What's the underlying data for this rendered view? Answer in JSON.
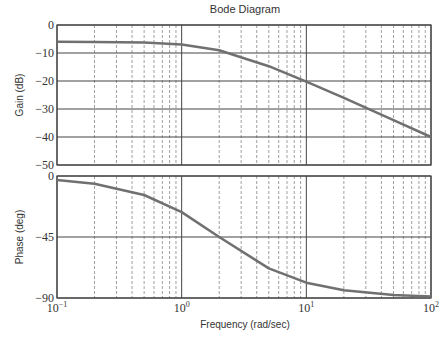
{
  "chart_data": [
    {
      "type": "line",
      "title": "Bode Diagram",
      "panel": "magnitude",
      "xlabel": "Frequency (rad/sec)",
      "ylabel": "Gain (dB)",
      "xscale": "log",
      "xlim": [
        0.1,
        100
      ],
      "ylim": [
        -50,
        0
      ],
      "yticks": [
        0,
        -10,
        -20,
        -30,
        -40,
        -50
      ],
      "grid": true,
      "series": [
        {
          "name": "Gain",
          "x": [
            0.1,
            0.2,
            0.5,
            1,
            2,
            5,
            10,
            20,
            50,
            100
          ],
          "values": [
            -6.0,
            -6.1,
            -6.3,
            -7.0,
            -9.0,
            -14.7,
            -20.2,
            -26.0,
            -34.0,
            -40.0
          ]
        }
      ]
    },
    {
      "type": "line",
      "panel": "phase",
      "xlabel": "Frequency (rad/sec)",
      "ylabel": "Phase (deg)",
      "xscale": "log",
      "xlim": [
        0.1,
        100
      ],
      "ylim": [
        -90,
        0
      ],
      "yticks": [
        0,
        -45,
        -90
      ],
      "xticks": [
        "10^-1",
        "10^0",
        "10^1",
        "10^2"
      ],
      "grid": true,
      "series": [
        {
          "name": "Phase",
          "x": [
            0.1,
            0.2,
            0.5,
            1,
            2,
            5,
            10,
            20,
            50,
            100
          ],
          "values": [
            -2.9,
            -5.7,
            -14.0,
            -26.6,
            -45.0,
            -68.2,
            -78.7,
            -84.3,
            -87.7,
            -88.9
          ]
        }
      ]
    }
  ],
  "labels": {
    "title": "Bode Diagram",
    "xlabel": "Frequency (rad/sec)",
    "gain_ylabel": "Gain (dB)",
    "phase_ylabel": "Phase (deg)",
    "gain_yticks": [
      "0",
      "−10",
      "−20",
      "−30",
      "−40",
      "−50"
    ],
    "phase_yticks": [
      "0",
      "−45",
      "−90"
    ],
    "xticks": [
      {
        "base": "10",
        "exp": "−1"
      },
      {
        "base": "10",
        "exp": "0"
      },
      {
        "base": "10",
        "exp": "1"
      },
      {
        "base": "10",
        "exp": "2"
      }
    ]
  },
  "colors": {
    "curve": "#707070",
    "grid": "#444444",
    "minor_grid": "#777777",
    "text": "#333333"
  }
}
